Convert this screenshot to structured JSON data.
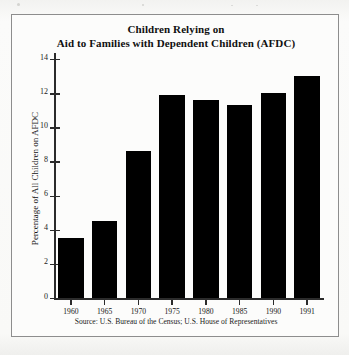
{
  "figure": {
    "title_line1": "Children Relying on",
    "title_line2": "Aid to Families with Dependent Children (AFDC)",
    "source_note": "Source: U.S. Bureau of the Census; U.S. House of Representatives",
    "frame_color": "#8d8d8d",
    "bar_color": "#000000",
    "axis_color": "#2b2b2b",
    "background_color": "#fcfcfb"
  },
  "chart_data": {
    "type": "bar",
    "title": "Children Relying on Aid to Families with Dependent Children (AFDC)",
    "xlabel": "",
    "ylabel": "Percentage of All Children on AFDC",
    "categories": [
      "1960",
      "1965",
      "1970",
      "1975",
      "1980",
      "1985",
      "1990",
      "1991"
    ],
    "values": [
      3.5,
      4.5,
      8.6,
      11.9,
      11.6,
      11.3,
      12.0,
      13.0
    ],
    "ylim": [
      0,
      14
    ],
    "ytick_labels": [
      "0",
      "2",
      "4",
      "6",
      "8",
      "10",
      "12",
      "14"
    ],
    "ytick_values": [
      0,
      2,
      4,
      6,
      8,
      10,
      12,
      14
    ],
    "grid": false,
    "legend": null,
    "source": "Source: U.S. Bureau of the Census; U.S. House of Representatives"
  }
}
